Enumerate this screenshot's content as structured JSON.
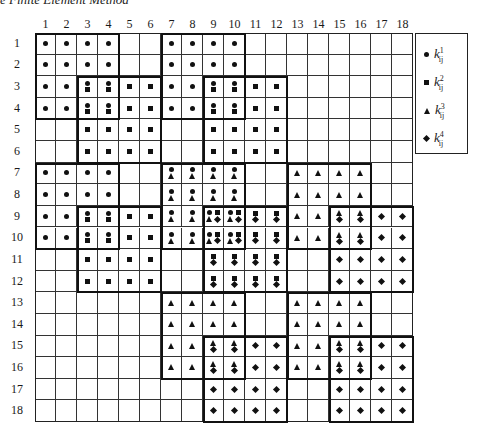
{
  "title": "e Finite Element Method",
  "grid": {
    "rows": 18,
    "cols": 18,
    "column_labels": [
      "1",
      "2",
      "3",
      "4",
      "5",
      "6",
      "7",
      "8",
      "9",
      "10",
      "11",
      "12",
      "13",
      "14",
      "15",
      "16",
      "17",
      "18"
    ],
    "row_labels": [
      "1",
      "2",
      "3",
      "4",
      "5",
      "6",
      "7",
      "8",
      "9",
      "10",
      "11",
      "12",
      "13",
      "14",
      "15",
      "16",
      "17",
      "18"
    ],
    "element_blocks": [
      {
        "element": 1,
        "symbol": "dot",
        "dofs": [
          1,
          2,
          3,
          4,
          7,
          8,
          9,
          10
        ]
      },
      {
        "element": 2,
        "symbol": "square",
        "dofs": [
          3,
          4,
          5,
          6,
          9,
          10,
          11,
          12
        ]
      },
      {
        "element": 3,
        "symbol": "triangle",
        "dofs": [
          7,
          8,
          9,
          10,
          13,
          14,
          15,
          16
        ]
      },
      {
        "element": 4,
        "symbol": "diamond",
        "dofs": [
          9,
          10,
          11,
          12,
          15,
          16,
          17,
          18
        ]
      }
    ]
  },
  "legend": {
    "items": [
      {
        "symbol": "dot",
        "label": "k",
        "sup": "1",
        "sub": "ij"
      },
      {
        "symbol": "square",
        "label": "k",
        "sup": "2",
        "sub": "ij"
      },
      {
        "symbol": "triangle",
        "label": "k",
        "sup": "3",
        "sub": "ij"
      },
      {
        "symbol": "diamond",
        "label": "k",
        "sup": "4",
        "sub": "ij"
      }
    ]
  }
}
